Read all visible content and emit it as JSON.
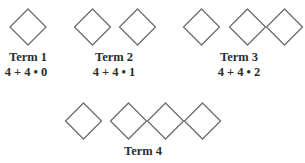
{
  "figure": {
    "stroke_color": "#6e6e6e",
    "text_color": "#2e2e2e",
    "terms": [
      {
        "name": "Term 1",
        "expression": "4 + 4 • 0",
        "squares": 1
      },
      {
        "name": "Term 2",
        "expression": "4 + 4 • 1",
        "squares": 2
      },
      {
        "name": "Term 3",
        "expression": "4 + 4 • 2",
        "squares": 3
      },
      {
        "name": "Term 4",
        "expression": "",
        "squares": 4
      }
    ]
  }
}
